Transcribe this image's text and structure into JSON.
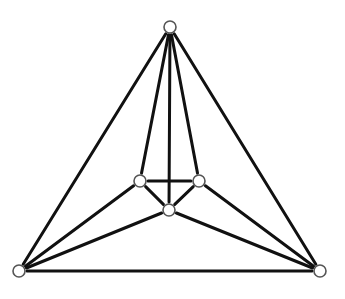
{
  "diagram": {
    "type": "graph",
    "colors": {
      "edge": "#111111",
      "node_stroke": "#555555",
      "node_fill": "#ffffff",
      "background": "#ffffff"
    },
    "node_radius": 6,
    "nodes": [
      {
        "id": "top",
        "x": 170,
        "y": 27
      },
      {
        "id": "bottom-left",
        "x": 19,
        "y": 271
      },
      {
        "id": "bottom-right",
        "x": 320,
        "y": 271
      },
      {
        "id": "inner-left",
        "x": 140,
        "y": 181
      },
      {
        "id": "inner-right",
        "x": 199,
        "y": 181
      },
      {
        "id": "inner-bottom",
        "x": 169,
        "y": 210
      }
    ],
    "edges": [
      [
        "top",
        "bottom-left"
      ],
      [
        "top",
        "bottom-right"
      ],
      [
        "bottom-left",
        "bottom-right"
      ],
      [
        "top",
        "inner-left"
      ],
      [
        "top",
        "inner-right"
      ],
      [
        "top",
        "inner-bottom"
      ],
      [
        "bottom-left",
        "inner-left"
      ],
      [
        "bottom-left",
        "inner-bottom"
      ],
      [
        "bottom-right",
        "inner-right"
      ],
      [
        "bottom-right",
        "inner-bottom"
      ],
      [
        "inner-left",
        "inner-right"
      ],
      [
        "inner-left",
        "inner-bottom"
      ],
      [
        "inner-right",
        "inner-bottom"
      ]
    ]
  }
}
